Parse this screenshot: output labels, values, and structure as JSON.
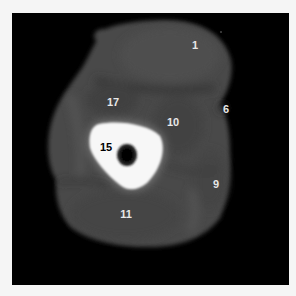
{
  "image": {
    "description": "Axial CT cross-section of a limb with numbered anatomical labels",
    "frame_color": "#000000",
    "background_color": "#f5f5f5"
  },
  "labels": [
    {
      "id": "1",
      "text": "1",
      "x": 195,
      "y": 45,
      "color": "#e8e8e8"
    },
    {
      "id": "6",
      "text": "6",
      "x": 226,
      "y": 109,
      "color": "#e8e8e8"
    },
    {
      "id": "17",
      "text": "17",
      "x": 113,
      "y": 102,
      "color": "#e8e8e8"
    },
    {
      "id": "10",
      "text": "10",
      "x": 173,
      "y": 122,
      "color": "#e8e8e8"
    },
    {
      "id": "15",
      "text": "15",
      "x": 106,
      "y": 147,
      "color": "#000000"
    },
    {
      "id": "9",
      "text": "9",
      "x": 216,
      "y": 184,
      "color": "#e8e8e8"
    },
    {
      "id": "11",
      "text": "11",
      "x": 126,
      "y": 214,
      "color": "#e8e8e8"
    }
  ]
}
